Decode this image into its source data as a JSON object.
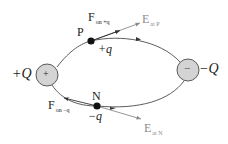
{
  "diagram": {
    "type": "electric-dipole-field-lines",
    "charges": {
      "positive": {
        "sign_glyph": "+",
        "label": "+Q"
      },
      "negative": {
        "sign_glyph": "−",
        "label": "−Q"
      }
    },
    "points": {
      "P": {
        "name": "P",
        "test_charge": "+q",
        "force_label": "F",
        "force_sub": "on +q",
        "field_label": "E",
        "field_sub": "at P"
      },
      "N": {
        "name": "N",
        "test_charge": "−q",
        "force_label": "F",
        "force_sub": "on −q",
        "field_label": "E",
        "field_sub": "at N"
      }
    },
    "colors": {
      "charge_fill": "#d4d4d4",
      "charge_stroke": "#5a5a5a",
      "field_line": "#4a4a4a",
      "field_vector": "#8a8a8a",
      "force_vector": "#333333",
      "dot": "#111111"
    }
  }
}
